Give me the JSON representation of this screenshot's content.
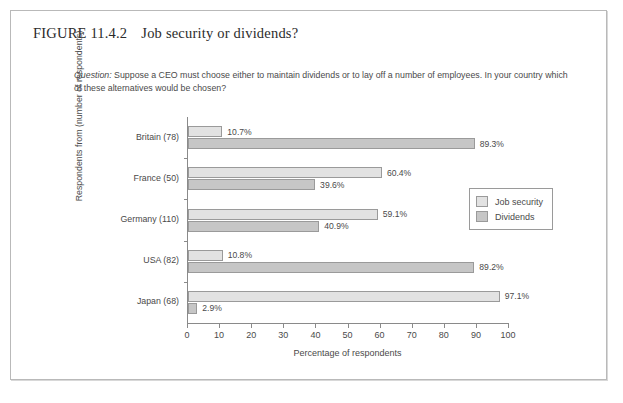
{
  "figure": {
    "number": "FIGURE 11.4.2",
    "title": "Job security or dividends?",
    "question_label": "Question:",
    "question_text": " Suppose a CEO must choose either to maintain dividends or to lay off a number of employees. In your country which of these alternatives would be chosen?"
  },
  "chart_data": {
    "type": "bar",
    "orientation": "horizontal",
    "title": "Job security or dividends?",
    "xlabel": "Percentage of respondents",
    "ylabel": "Respondents from (number of respondents)",
    "xlim": [
      0,
      100
    ],
    "xticks": [
      0,
      10,
      20,
      30,
      40,
      50,
      60,
      70,
      80,
      90,
      100
    ],
    "grid": false,
    "legend_position": "right",
    "categories": [
      "Britain (78)",
      "France (50)",
      "Germany (110)",
      "USA (82)",
      "Japan (68)"
    ],
    "series": [
      {
        "name": "Job security",
        "color": "#e2e2e2",
        "values": [
          10.7,
          60.4,
          59.1,
          10.8,
          97.1
        ],
        "labels": [
          "10.7%",
          "60.4%",
          "59.1%",
          "10.8%",
          "97.1%"
        ]
      },
      {
        "name": "Dividends",
        "color": "#c6c6c6",
        "values": [
          89.3,
          39.6,
          40.9,
          89.2,
          2.9
        ],
        "labels": [
          "89.3%",
          "39.6%",
          "40.9%",
          "89.2%",
          "2.9%"
        ]
      }
    ]
  }
}
